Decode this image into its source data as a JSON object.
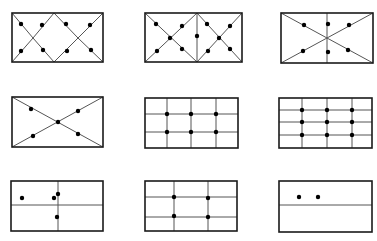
{
  "figure": {
    "stroke_color": "#1a1a1a",
    "line_color": "#555555",
    "dot_color": "#000000",
    "panels": [
      {
        "id": "p1",
        "rect": [
          12,
          13,
          103,
          62
        ],
        "lines": [
          [
            12,
            13,
            33,
            38
          ],
          [
            33,
            38,
            54,
            62
          ],
          [
            12,
            62,
            33,
            38
          ],
          [
            33,
            38,
            54,
            13
          ],
          [
            54,
            13,
            78,
            38
          ],
          [
            78,
            38,
            103,
            62
          ],
          [
            54,
            62,
            78,
            38
          ],
          [
            78,
            38,
            103,
            13
          ]
        ],
        "dots": [
          [
            21,
            24
          ],
          [
            42,
            25
          ],
          [
            66,
            24
          ],
          [
            90,
            25
          ],
          [
            21,
            51
          ],
          [
            43,
            50
          ],
          [
            67,
            51
          ],
          [
            91,
            50
          ]
        ]
      },
      {
        "id": "p2",
        "rect": [
          145,
          13,
          242,
          62
        ],
        "lines": [
          [
            197,
            13,
            197,
            62
          ],
          [
            145,
            13,
            197,
            62
          ],
          [
            145,
            62,
            197,
            13
          ],
          [
            197,
            13,
            242,
            62
          ],
          [
            197,
            62,
            242,
            13
          ]
        ],
        "dots": [
          [
            156,
            24
          ],
          [
            182,
            26
          ],
          [
            170,
            38
          ],
          [
            157,
            51
          ],
          [
            182,
            49
          ],
          [
            197,
            36
          ],
          [
            207,
            24
          ],
          [
            230,
            26
          ],
          [
            219,
            38
          ],
          [
            208,
            51
          ],
          [
            230,
            49
          ]
        ]
      },
      {
        "id": "p3",
        "rect": [
          281,
          13,
          373,
          63
        ],
        "lines": [
          [
            327,
            13,
            327,
            63
          ],
          [
            281,
            13,
            373,
            63
          ],
          [
            281,
            63,
            373,
            13
          ]
        ],
        "dots": [
          [
            304,
            25
          ],
          [
            328,
            24
          ],
          [
            349,
            25
          ],
          [
            303,
            51
          ],
          [
            328,
            52
          ],
          [
            348,
            50
          ]
        ]
      },
      {
        "id": "p4",
        "rect": [
          12,
          97,
          103,
          147
        ],
        "lines": [
          [
            12,
            97,
            103,
            147
          ],
          [
            12,
            147,
            103,
            97
          ]
        ],
        "dots": [
          [
            31,
            109
          ],
          [
            78,
            111
          ],
          [
            58,
            122
          ],
          [
            33,
            136
          ],
          [
            78,
            134
          ]
        ]
      },
      {
        "id": "p5",
        "rect": [
          145,
          98,
          238,
          148
        ],
        "lines": [
          [
            167,
            98,
            167,
            148
          ],
          [
            191,
            98,
            191,
            148
          ],
          [
            216,
            98,
            216,
            148
          ],
          [
            145,
            114,
            238,
            114
          ],
          [
            145,
            132,
            238,
            132
          ]
        ],
        "dots": [
          [
            167,
            114
          ],
          [
            191,
            114
          ],
          [
            216,
            114
          ],
          [
            167,
            132
          ],
          [
            191,
            132
          ],
          [
            216,
            132
          ]
        ]
      },
      {
        "id": "p6",
        "rect": [
          279,
          98,
          372,
          148
        ],
        "lines": [
          [
            302,
            98,
            302,
            148
          ],
          [
            327,
            98,
            327,
            148
          ],
          [
            352,
            98,
            352,
            148
          ],
          [
            279,
            110,
            372,
            110
          ],
          [
            279,
            122,
            372,
            122
          ],
          [
            279,
            135,
            372,
            135
          ]
        ],
        "dots": [
          [
            302,
            110
          ],
          [
            327,
            110
          ],
          [
            352,
            110
          ],
          [
            302,
            122
          ],
          [
            327,
            122
          ],
          [
            352,
            122
          ],
          [
            302,
            135
          ],
          [
            327,
            135
          ],
          [
            352,
            135
          ]
        ]
      },
      {
        "id": "p7",
        "rect": [
          11,
          181,
          103,
          231
        ],
        "lines": [
          [
            58,
            181,
            58,
            231
          ],
          [
            11,
            205,
            103,
            205
          ]
        ],
        "dots": [
          [
            22,
            198
          ],
          [
            54,
            198
          ],
          [
            58,
            194
          ],
          [
            57,
            217
          ]
        ]
      },
      {
        "id": "p8",
        "rect": [
          145,
          181,
          237,
          231
        ],
        "lines": [
          [
            174,
            181,
            174,
            231
          ],
          [
            208,
            181,
            208,
            231
          ],
          [
            145,
            197,
            237,
            197
          ],
          [
            145,
            217,
            237,
            217
          ]
        ],
        "dots": [
          [
            174,
            197
          ],
          [
            208,
            198
          ],
          [
            174,
            216
          ],
          [
            208,
            217
          ]
        ]
      },
      {
        "id": "p9",
        "rect": [
          279,
          181,
          372,
          232
        ],
        "lines": [
          [
            279,
            205,
            372,
            205
          ]
        ],
        "dots": [
          [
            299,
            197
          ],
          [
            318,
            197
          ]
        ]
      }
    ]
  }
}
